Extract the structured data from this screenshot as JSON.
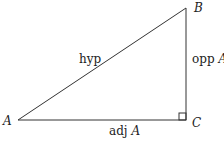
{
  "diagram": {
    "vertices": {
      "A": "A",
      "B": "B",
      "C": "C"
    },
    "sides": {
      "hypotenuse": "hyp",
      "opposite": {
        "text": "opp",
        "var": "A"
      },
      "adjacent": {
        "text": "adj",
        "var": "A"
      }
    },
    "colors": {
      "line": "#333333",
      "background": "#ffffff"
    }
  }
}
